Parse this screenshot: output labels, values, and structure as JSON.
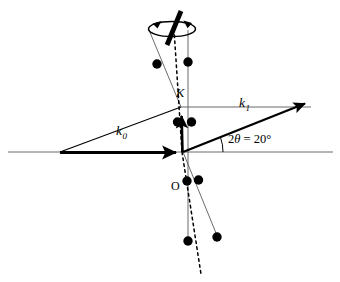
{
  "figure": {
    "width": 340,
    "height": 282,
    "background_color": "#ffffff",
    "line_color": "#000000",
    "thin_line_color": "#4a4a4a"
  },
  "labels": {
    "k0": {
      "base": "k",
      "sub": "0",
      "x": 118,
      "y": 131
    },
    "k1": {
      "base": "k",
      "sub": "1",
      "x": 240,
      "y": 103
    },
    "K": {
      "text": "K",
      "x": 177,
      "y": 94
    },
    "O": {
      "text": "O",
      "x": 172,
      "y": 186
    },
    "angle": {
      "prefix": "2",
      "theta": "θ",
      "rest": " = 20°",
      "x": 228,
      "y": 140
    }
  },
  "geometry": {
    "origin": {
      "x": 182,
      "y": 152
    },
    "k_point": {
      "x": 181,
      "y": 107
    },
    "k0_start": {
      "x": 60,
      "y": 152
    },
    "k1_tip": {
      "x": 311,
      "y": 103
    },
    "baseline_y": 152,
    "baseline_x0": 8,
    "baseline_x1": 333,
    "two_theta_degrees": 20,
    "rotation_axis_top": {
      "x": 176,
      "y": 12
    },
    "rotation_axis_bottom": {
      "x": 202,
      "y": 274
    }
  },
  "lattice_points": [
    {
      "name": "upper-left-node",
      "x": 157,
      "y": 64,
      "r": 4.6
    },
    {
      "name": "upper-right-node",
      "x": 188,
      "y": 62,
      "r": 4.6
    },
    {
      "name": "center-left-node",
      "x": 178,
      "y": 122,
      "r": 4.6
    },
    {
      "name": "center-right-node",
      "x": 192,
      "y": 122,
      "r": 4.6
    },
    {
      "name": "below-left-node",
      "x": 187,
      "y": 181,
      "r": 4.6
    },
    {
      "name": "below-right-node",
      "x": 198,
      "y": 180,
      "r": 4.6
    },
    {
      "name": "lower-left-node",
      "x": 188,
      "y": 241,
      "r": 4.6
    },
    {
      "name": "lower-right-node",
      "x": 217,
      "y": 237,
      "r": 4.6
    }
  ],
  "rotation": {
    "rod_top": {
      "x": 180,
      "y": 13
    },
    "rod_bottom": {
      "x": 168,
      "y": 43
    },
    "rod_width": 4.6,
    "ellipse_cx": 172,
    "ellipse_cy": 29,
    "ellipse_rx": 23,
    "ellipse_ry": 7.5,
    "left_arrow": true,
    "right_arrow": true
  },
  "colors": {
    "ink": "#000000",
    "thin": "#555555",
    "paper": "#ffffff"
  }
}
